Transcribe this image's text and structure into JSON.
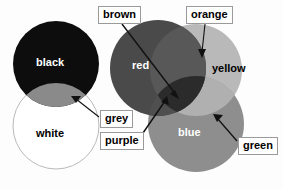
{
  "figure": {
    "kind": "colour-mixing-venn-diagram",
    "background": "#fdfdfd"
  },
  "regions": {
    "black": {
      "label": "black",
      "color": "#0d0d0d",
      "text_color": "#ffffff"
    },
    "white": {
      "label": "white",
      "color": "#ffffff",
      "text_color": "#000000",
      "stroke": "#b5b5b5"
    },
    "grey": {
      "label": "grey",
      "color": "#8a8a8a"
    },
    "red": {
      "label": "red",
      "color": "#4a4a4a",
      "text_color": "#ffffff"
    },
    "yellow": {
      "label": "yellow",
      "color": "#b9b9b9",
      "text_color": "#000000"
    },
    "blue": {
      "label": "blue",
      "color": "#8e8e8e",
      "text_color": "#ffffff"
    },
    "orange": {
      "label": "orange",
      "color": "#b2b2b2"
    },
    "purple": {
      "label": "purple",
      "color": "#4f4f4f"
    },
    "green": {
      "label": "green",
      "color": "#b0b0b0"
    },
    "brown": {
      "label": "brown",
      "color": "#2b2b2b"
    }
  },
  "callouts": [
    {
      "id": "brown",
      "label": "brown",
      "x": 98,
      "y": 6,
      "w": 48,
      "h": 17
    },
    {
      "id": "orange",
      "label": "orange",
      "x": 186,
      "y": 6,
      "w": 52,
      "h": 17
    },
    {
      "id": "grey",
      "label": "grey",
      "x": 100,
      "y": 110,
      "w": 38,
      "h": 17
    },
    {
      "id": "purple",
      "label": "purple",
      "x": 100,
      "y": 132,
      "w": 48,
      "h": 17
    },
    {
      "id": "green",
      "label": "green",
      "x": 238,
      "y": 137,
      "w": 42,
      "h": 17
    }
  ],
  "inline_labels": [
    {
      "id": "black",
      "label": "black",
      "x": 36,
      "y": 57,
      "tone": "on-dark"
    },
    {
      "id": "white",
      "label": "white",
      "x": 36,
      "y": 128,
      "tone": "on-light"
    },
    {
      "id": "red",
      "label": "red",
      "x": 132,
      "y": 60,
      "tone": "on-dark"
    },
    {
      "id": "yellow",
      "label": "yellow",
      "x": 212,
      "y": 63,
      "tone": "on-light"
    },
    {
      "id": "blue",
      "label": "blue",
      "x": 178,
      "y": 127,
      "tone": "on-dark"
    }
  ],
  "leader_lines": [
    {
      "id": "brown-leader",
      "from": "brown-callout",
      "to": "brown-region"
    },
    {
      "id": "orange-leader",
      "from": "orange-callout",
      "to": "orange-region"
    },
    {
      "id": "grey-leader",
      "from": "grey-callout",
      "to": "grey-region"
    },
    {
      "id": "purple-leader",
      "from": "purple-callout",
      "to": "purple-region"
    },
    {
      "id": "green-leader",
      "from": "green-callout",
      "to": "green-region"
    }
  ]
}
